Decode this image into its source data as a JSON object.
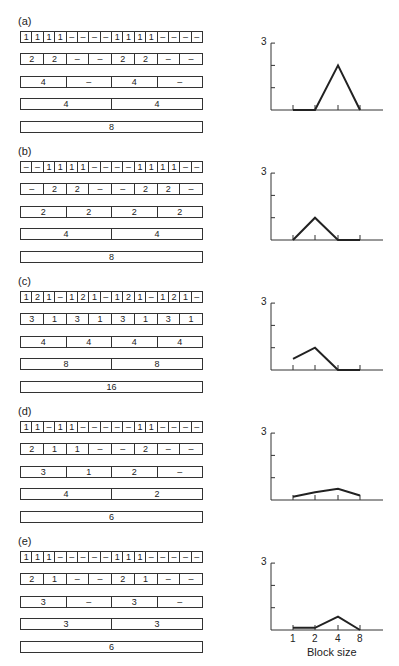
{
  "panels": [
    {
      "label": "(a)",
      "rows": [
        [
          "1",
          "1",
          "1",
          "1",
          "–",
          "–",
          "–",
          "–",
          "1",
          "1",
          "1",
          "1",
          "–",
          "–",
          "–",
          "–"
        ],
        [
          "2",
          "2",
          "–",
          "–",
          "2",
          "2",
          "–",
          "–"
        ],
        [
          "4",
          "–",
          "4",
          "–"
        ],
        [
          "4",
          "4"
        ],
        [
          "8"
        ]
      ]
    },
    {
      "label": "(b)",
      "rows": [
        [
          "–",
          "–",
          "1",
          "1",
          "1",
          "1",
          "–",
          "–",
          "–",
          "–",
          "1",
          "1",
          "1",
          "1",
          "–",
          "–"
        ],
        [
          "–",
          "2",
          "2",
          "–",
          "–",
          "2",
          "2",
          "–"
        ],
        [
          "2",
          "2",
          "2",
          "2"
        ],
        [
          "4",
          "4"
        ],
        [
          "8"
        ]
      ]
    },
    {
      "label": "(c)",
      "rows": [
        [
          "1",
          "2",
          "1",
          "–",
          "1",
          "2",
          "1",
          "–",
          "1",
          "2",
          "1",
          "–",
          "1",
          "2",
          "1",
          "–"
        ],
        [
          "3",
          "1",
          "3",
          "1",
          "3",
          "1",
          "3",
          "1"
        ],
        [
          "4",
          "4",
          "4",
          "4"
        ],
        [
          "8",
          "8"
        ],
        [
          "16"
        ]
      ]
    },
    {
      "label": "(d)",
      "rows": [
        [
          "1",
          "1",
          "–",
          "1",
          "1",
          "–",
          "–",
          "–",
          "–",
          "–",
          "1",
          "1",
          "–",
          "–",
          "–",
          "–"
        ],
        [
          "2",
          "1",
          "1",
          "–",
          "–",
          "2",
          "–",
          "–"
        ],
        [
          "3",
          "1",
          "2",
          "–"
        ],
        [
          "4",
          "2"
        ],
        [
          "6"
        ]
      ]
    },
    {
      "label": "(e)",
      "rows": [
        [
          "1",
          "1",
          "1",
          "–",
          "–",
          "–",
          "–",
          "–",
          "1",
          "1",
          "1",
          "–",
          "–",
          "–",
          "–",
          "–"
        ],
        [
          "2",
          "1",
          "–",
          "–",
          "2",
          "1",
          "–",
          "–"
        ],
        [
          "3",
          "–",
          "3",
          "–"
        ],
        [
          "3",
          "3"
        ],
        [
          "6"
        ]
      ]
    }
  ],
  "graph_axis": {
    "y_top_label": "3",
    "x_tick_labels": [
      "1",
      "2",
      "4",
      "8"
    ],
    "x_title": "Block size"
  },
  "chart_data": [
    {
      "type": "line",
      "title": "(a)",
      "categories": [
        "1",
        "2",
        "4",
        "8"
      ],
      "values": [
        0,
        0,
        2,
        0
      ],
      "xlabel": "Block size",
      "ylabel": "",
      "ylim": [
        0,
        3
      ]
    },
    {
      "type": "line",
      "title": "(b)",
      "categories": [
        "1",
        "2",
        "4",
        "8"
      ],
      "values": [
        0,
        1,
        0,
        0
      ],
      "xlabel": "Block size",
      "ylabel": "",
      "ylim": [
        0,
        3
      ]
    },
    {
      "type": "line",
      "title": "(c)",
      "categories": [
        "1",
        "2",
        "4",
        "8"
      ],
      "values": [
        0.5,
        1,
        0,
        0
      ],
      "xlabel": "Block size",
      "ylabel": "",
      "ylim": [
        0,
        3
      ]
    },
    {
      "type": "line",
      "title": "(d)",
      "categories": [
        "1",
        "2",
        "4",
        "8"
      ],
      "values": [
        0.15,
        0.35,
        0.5,
        0.2
      ],
      "xlabel": "Block size",
      "ylabel": "",
      "ylim": [
        0,
        3
      ]
    },
    {
      "type": "line",
      "title": "(e)",
      "categories": [
        "1",
        "2",
        "4",
        "8"
      ],
      "values": [
        0.1,
        0.1,
        0.6,
        0
      ],
      "xlabel": "Block size",
      "ylabel": "",
      "ylim": [
        0,
        3
      ]
    }
  ]
}
